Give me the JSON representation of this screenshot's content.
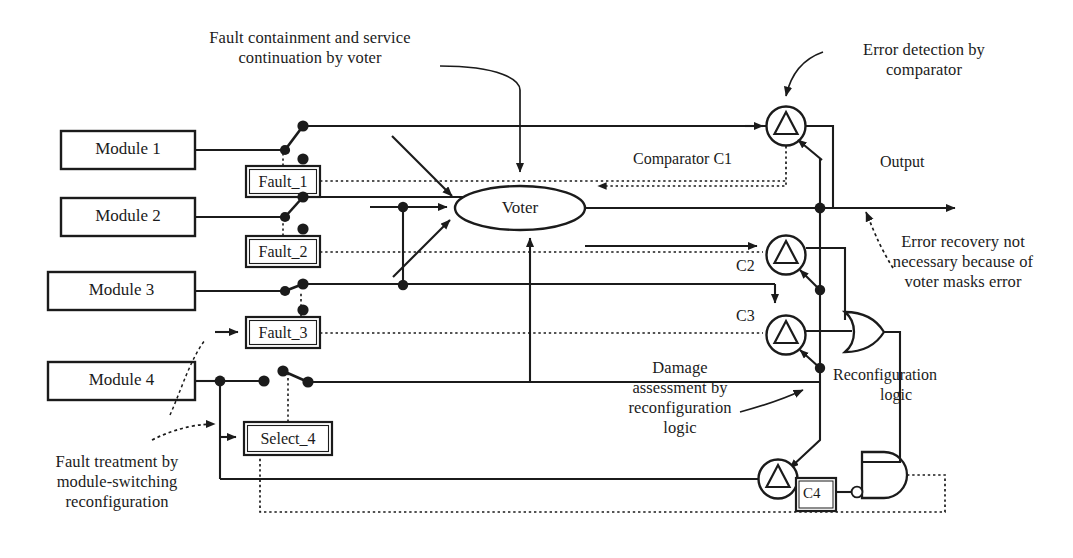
{
  "figure": {
    "type": "block-diagram",
    "background": "#ffffff",
    "line_color": "#1b1b1b",
    "text_color": "#1b1b1b"
  },
  "modules": [
    {
      "id": "module-1",
      "label": "Module 1"
    },
    {
      "id": "module-2",
      "label": "Module 2"
    },
    {
      "id": "module-3",
      "label": "Module 3"
    },
    {
      "id": "module-4",
      "label": "Module 4"
    }
  ],
  "signal_boxes": [
    {
      "id": "fault-1",
      "label": "Fault_1"
    },
    {
      "id": "fault-2",
      "label": "Fault_2"
    },
    {
      "id": "fault-3",
      "label": "Fault_3"
    },
    {
      "id": "select-4",
      "label": "Select_4"
    }
  ],
  "voter": {
    "label": "Voter"
  },
  "comparators": [
    {
      "id": "c1",
      "label": "Comparator C1"
    },
    {
      "id": "c2",
      "label": "C2"
    },
    {
      "id": "c3",
      "label": "C3"
    },
    {
      "id": "c4",
      "label": "C4"
    }
  ],
  "output": {
    "label": "Output"
  },
  "logic": {
    "reconfiguration_label_line1": "Reconfiguration",
    "reconfiguration_label_line2": "logic"
  },
  "annotations": [
    {
      "id": "fault-containment",
      "lines": [
        "Fault containment and service",
        "continuation by voter"
      ]
    },
    {
      "id": "error-detection",
      "lines": [
        "Error detection by",
        "comparator"
      ]
    },
    {
      "id": "error-recovery",
      "lines": [
        "Error recovery not",
        "necessary because of",
        "voter masks error"
      ]
    },
    {
      "id": "damage-assessment",
      "lines": [
        "Damage",
        "assessment by",
        "reconfiguration",
        "logic"
      ]
    },
    {
      "id": "fault-treatment",
      "lines": [
        "Fault treatment by",
        "module-switching",
        "reconfiguration"
      ]
    }
  ]
}
